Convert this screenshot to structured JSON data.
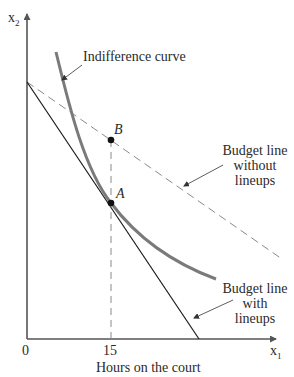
{
  "diagram": {
    "type": "consumer-choice indifference curve diagram",
    "axes": {
      "y_label": "x",
      "y_label_sub": "2",
      "x_label": "x",
      "x_label_sub": "1",
      "x_title": "Hours on the court",
      "origin_label": "0",
      "x_tick_label": "15"
    },
    "curves": {
      "indifference_curve_label": "Indifference curve",
      "budget_without_lines": [
        "Budget line",
        "without",
        "lineups"
      ],
      "budget_with_lines": [
        "Budget line",
        "with",
        "lineups"
      ]
    },
    "points": {
      "a_label": "A",
      "b_label": "B"
    },
    "colors": {
      "axis": "#555555",
      "indifference_curve": "#7a7a7a",
      "budget_with": "#1a1a1a",
      "budget_without": "#8a8a8a",
      "text": "#2a2a2a"
    }
  }
}
